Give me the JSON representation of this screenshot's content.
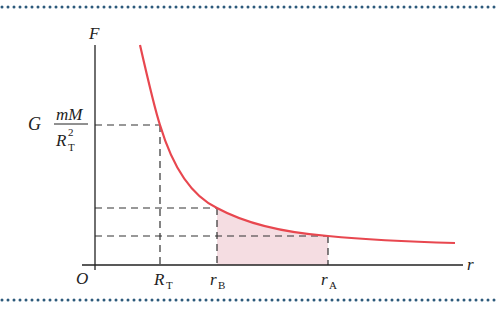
{
  "diagram": {
    "colors": {
      "curve": "#e8474f",
      "fill": "#f5dde2",
      "axis": "#222222",
      "dash": "#333333",
      "border_dots": "#2d5a7b"
    },
    "axes": {
      "y_label": "F",
      "x_label": "r",
      "origin_label": "O"
    },
    "y_annotation": {
      "prefix": "G",
      "numerator": "mM",
      "denominator_base": "R",
      "denominator_sub": "T",
      "denominator_sup": "2"
    },
    "x_marks": [
      {
        "base": "R",
        "sub": "T"
      },
      {
        "base": "r",
        "sub": "B"
      },
      {
        "base": "r",
        "sub": "A"
      }
    ],
    "shaded_region": "area under curve between r_B and r_A"
  }
}
